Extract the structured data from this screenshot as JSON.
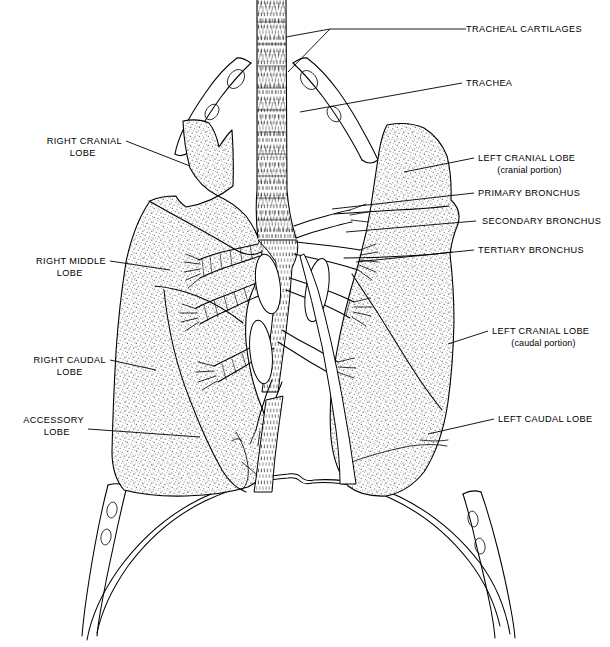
{
  "figure": {
    "background_color": "#ffffff",
    "line_color": "#000000",
    "width": 610,
    "height": 647
  },
  "labels": [
    {
      "id": "tracheal-cartilages",
      "text": "TRACHEAL CARTILAGES",
      "sub": "",
      "align": "left",
      "x": 466,
      "y": 32,
      "leader": "M 466 29 L 330 29 L 286 37 M 330 29 L 288 72"
    },
    {
      "id": "trachea",
      "text": "TRACHEA",
      "sub": "",
      "align": "left",
      "x": 466,
      "y": 86,
      "leader": "M 462 83 L 300 112"
    },
    {
      "id": "left-cranial-lobe-cranial",
      "text": "LEFT CRANIAL LOBE",
      "sub": "(cranial portion)",
      "align": "left",
      "x": 478,
      "y": 161,
      "leader": "M 474 158 L 404 172"
    },
    {
      "id": "primary-bronchus",
      "text": "PRIMARY BRONCHUS",
      "sub": "",
      "align": "left",
      "x": 478,
      "y": 196,
      "leader": "M 474 193 L 332 209"
    },
    {
      "id": "secondary-bronchus",
      "text": "SECONDARY BRONCHUS",
      "sub": "",
      "align": "left",
      "x": 482,
      "y": 224,
      "leader": "M 476 221 L 346 232"
    },
    {
      "id": "tertiary-bronchus",
      "text": "TERTIARY BRONCHUS",
      "sub": "",
      "align": "left",
      "x": 478,
      "y": 253,
      "leader": "M 474 250 L 356 262"
    },
    {
      "id": "left-cranial-lobe-caudal",
      "text": "LEFT CRANIAL LOBE",
      "sub": "(caudal portion)",
      "align": "left",
      "x": 492,
      "y": 334,
      "leader": "M 488 331 L 448 344"
    },
    {
      "id": "left-caudal-lobe",
      "text": "LEFT CAUDAL LOBE",
      "sub": "",
      "align": "left",
      "x": 498,
      "y": 422,
      "leader": "M 494 419 L 428 434"
    },
    {
      "id": "right-cranial-lobe",
      "text": "RIGHT CRANIAL",
      "sub": "LOBE",
      "align": "right",
      "x": 122,
      "y": 144,
      "leader": "M 126 141 L 190 166"
    },
    {
      "id": "right-middle-lobe",
      "text": "RIGHT MIDDLE",
      "sub": "LOBE",
      "align": "right",
      "x": 106,
      "y": 264,
      "leader": "M 110 261 L 170 270"
    },
    {
      "id": "right-caudal-lobe",
      "text": "RIGHT CAUDAL",
      "sub": "LOBE",
      "align": "right",
      "x": 106,
      "y": 363,
      "leader": "M 110 360 L 156 370"
    },
    {
      "id": "accessory-lobe",
      "text": "ACCESSORY",
      "sub": "LOBE",
      "align": "right",
      "x": 84,
      "y": 423,
      "leader": "M 88 429 L 200 437"
    }
  ],
  "structures": [
    {
      "id": "trachea",
      "name": "trachea"
    },
    {
      "id": "tracheal-cartilages",
      "name": "tracheal-cartilages"
    },
    {
      "id": "carina",
      "name": "tracheal-bifurcation"
    },
    {
      "id": "primary-bronchus-left",
      "name": "primary-bronchus-left"
    },
    {
      "id": "primary-bronchus-right",
      "name": "primary-bronchus-right"
    },
    {
      "id": "right-lung",
      "name": "right-lung"
    },
    {
      "id": "left-lung",
      "name": "left-lung"
    },
    {
      "id": "diaphragm",
      "name": "diaphragm"
    },
    {
      "id": "ribs",
      "name": "ribs-with-foramina"
    }
  ]
}
